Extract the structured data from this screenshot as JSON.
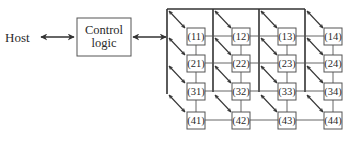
{
  "diagram": {
    "host_label": "Host",
    "control_logic": {
      "line1": "Control",
      "line2": "logic"
    },
    "array": {
      "rows": 4,
      "cols": 4,
      "cells": [
        [
          "(11)",
          "(12)",
          "(13)",
          "(14)"
        ],
        [
          "(21)",
          "(22)",
          "(23)",
          "(24)"
        ],
        [
          "(31)",
          "(32)",
          "(33)",
          "(34)"
        ],
        [
          "(41)",
          "(42)",
          "(43)",
          "(44)"
        ]
      ]
    },
    "colors": {
      "line": "#333333",
      "box_border": "#555555",
      "text": "#2a2a2a"
    }
  }
}
